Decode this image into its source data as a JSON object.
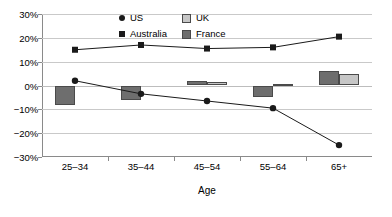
{
  "chart_data": {
    "type": "bar",
    "title": "",
    "xlabel": "Age",
    "ylabel": "",
    "categories": [
      "25–34",
      "35–44",
      "45–54",
      "55–64",
      "65+"
    ],
    "ylim": [
      -30,
      30
    ],
    "ytick_values": [
      30,
      20,
      10,
      0,
      -10,
      -20,
      -30
    ],
    "ytick_labels": [
      "30%",
      "20%",
      "10%",
      "0%",
      "−10%",
      "−20%",
      "−30%"
    ],
    "grid": true,
    "legend_position": "top-center",
    "series": [
      {
        "name": "US",
        "kind": "line",
        "marker": "circle",
        "color": "#1a1a1a",
        "values": [
          2,
          -3.5,
          -6.5,
          -9.5,
          -25
        ]
      },
      {
        "name": "Australia",
        "kind": "line",
        "marker": "square",
        "color": "#1a1a1a",
        "values": [
          15,
          17,
          15.5,
          16,
          20.5
        ]
      },
      {
        "name": "UK",
        "kind": "bar",
        "color": "#c6c6c6",
        "values": [
          null,
          null,
          1.5,
          0.7,
          5
        ]
      },
      {
        "name": "France",
        "kind": "bar",
        "color": "#6e6e6e",
        "values": [
          -8,
          -6,
          2,
          -5,
          6
        ]
      }
    ]
  },
  "legend": {
    "entries": [
      {
        "label": "US",
        "swatch": "circle-marker-icon"
      },
      {
        "label": "UK",
        "swatch": "light-gray-box-icon"
      },
      {
        "label": "Australia",
        "swatch": "square-marker-icon"
      },
      {
        "label": "France",
        "swatch": "dark-gray-box-icon"
      }
    ]
  },
  "colors": {
    "uk_fill": "#c6c6c6",
    "france_fill": "#6e6e6e",
    "bar_stroke": "#4a4a4a",
    "line": "#1a1a1a",
    "grid": "#c9c9c9",
    "axis": "#8a8a8a"
  }
}
